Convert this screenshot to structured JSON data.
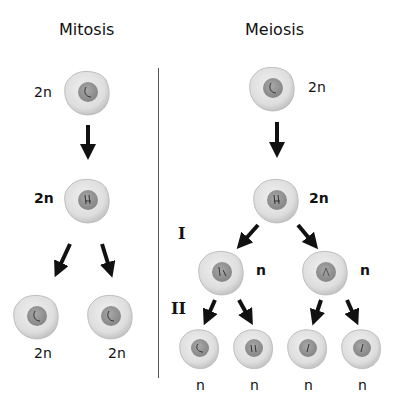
{
  "titles": {
    "mitosis": "Mitosis",
    "meiosis": "Meiosis"
  },
  "mitosis": {
    "parent_label": "2n",
    "replicated_label": "2n",
    "daughter_labels": [
      "2n",
      "2n"
    ]
  },
  "meiosis": {
    "parent_label": "2n",
    "replicated_label": "2n",
    "division_I_label": "I",
    "division_II_label": "II",
    "meiosis_I_labels": [
      "n",
      "n"
    ],
    "meiosis_II_labels": [
      "n",
      "n",
      "n",
      "n"
    ]
  },
  "colors": {
    "cell_fill": "#e2e2e2",
    "cell_edge": "#b5b5b5",
    "nucleus": "#9c9c9c",
    "arrow": "#111111",
    "divider": "#555555"
  }
}
